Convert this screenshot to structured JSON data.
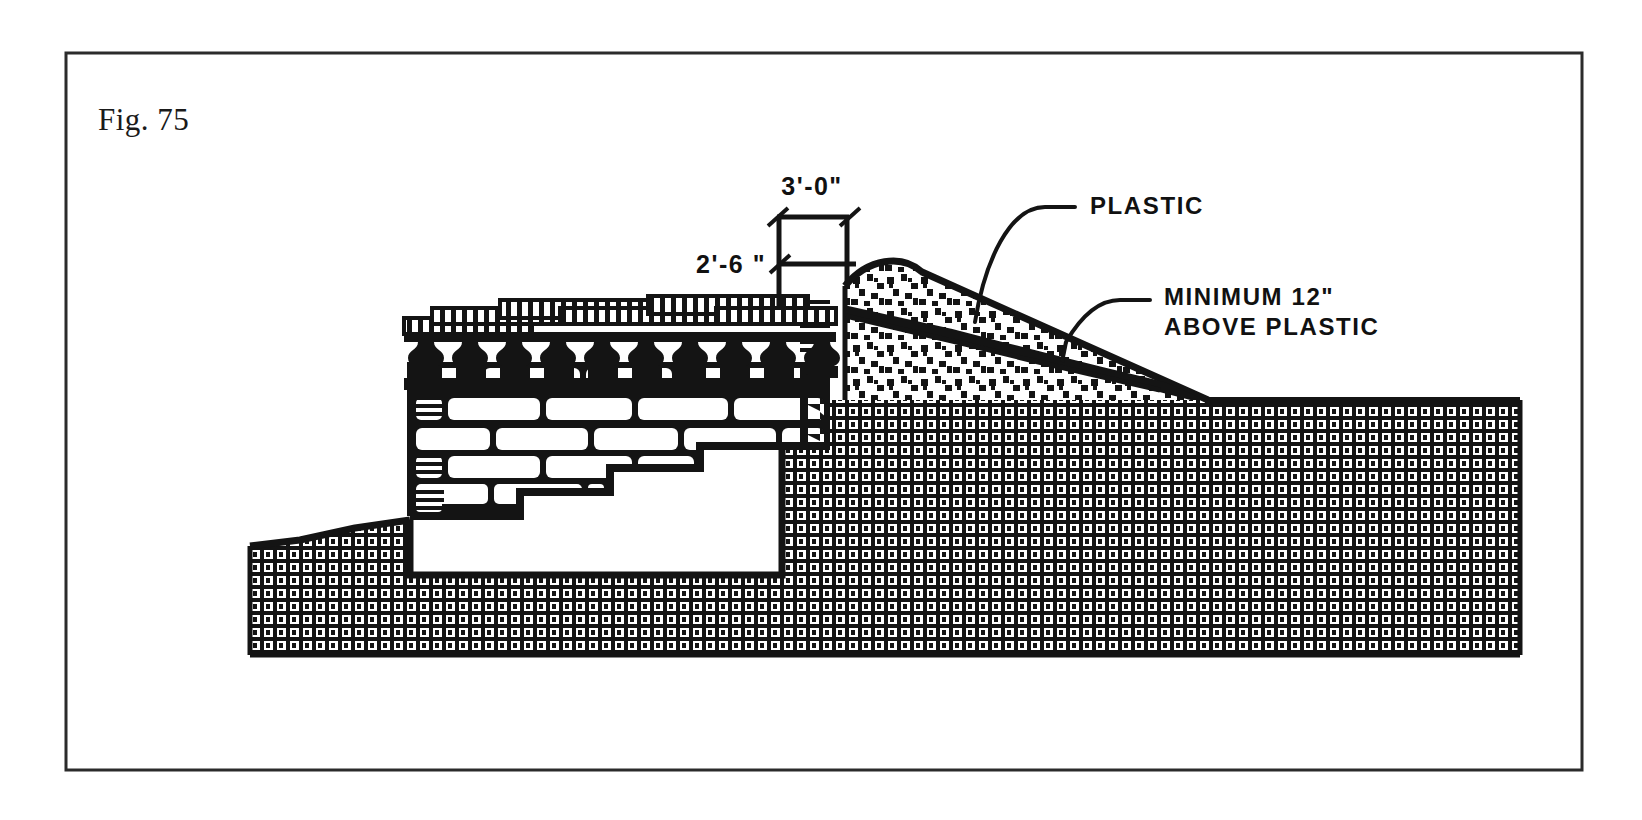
{
  "sheet": {
    "background_color": "#ffffff",
    "ink_color": "#141414",
    "border": {
      "name": "figure-border",
      "x": 66,
      "y": 53,
      "width": 1516,
      "height": 717,
      "stroke_width": 3
    }
  },
  "figure": {
    "label": "Fig. 75",
    "title_position": {
      "x": 98,
      "y": 130
    }
  },
  "dimensions": [
    {
      "id": "berm-width",
      "text": "3'-0\"",
      "text_x": 812,
      "text_y": 195,
      "line_y": 217,
      "left_x": 777,
      "right_x": 849,
      "tick_style": "architectural-slash",
      "extension_bottom_y": 300
    },
    {
      "id": "wall-height-above-grade",
      "text": "2'-6 \"",
      "text_x": 712,
      "text_y": 272,
      "line_y": 264,
      "left_x": 777,
      "right_x": 849,
      "tick_style": "architectural-slash"
    }
  ],
  "callouts": [
    {
      "id": "plastic",
      "text": "PLASTIC",
      "text_x": 1090,
      "text_y": 214,
      "leader_start_x": 1075,
      "leader_start_y": 207,
      "leader_anchor_x": 975,
      "leader_anchor_y": 322
    },
    {
      "id": "minimum-cover",
      "line1": "MINIMUM 12\"",
      "line2": "ABOVE PLASTIC",
      "text_x": 1164,
      "text_y": 305,
      "line_gap": 30,
      "leader_start_x": 1150,
      "leader_start_y": 300,
      "leader_anchor_x": 1065,
      "leader_anchor_y": 343
    }
  ],
  "components": {
    "earth_ground": {
      "name": "earth-fill-hatch",
      "pattern": "basket-weave-crosshatch",
      "description": "undisturbed soil / grade"
    },
    "gravel_berm": {
      "name": "gravel-berm",
      "pattern": "random-stipple-squares",
      "description": "crowned gravel backfill berm over plastic"
    },
    "plastic_membrane": {
      "name": "plastic-membrane-line",
      "description": "heavy black line running diagonally through berm"
    },
    "masonry_wall": {
      "name": "stone-masonry-wall",
      "pattern": "running-bond-blocks",
      "courses": 9
    },
    "wall_cap": {
      "name": "wall-cap-hatch",
      "pattern": "vertical-tick-hatch",
      "steps": 6
    },
    "pier_row": {
      "name": "pier-row",
      "count": 11,
      "description": "dark mushroom-shaped supports under cap"
    },
    "footing_void": {
      "name": "footing-void",
      "description": "white excavated area below stepped wall base"
    },
    "wall_face_arrows": {
      "name": "drainage-arrow-column",
      "count": 9
    }
  }
}
